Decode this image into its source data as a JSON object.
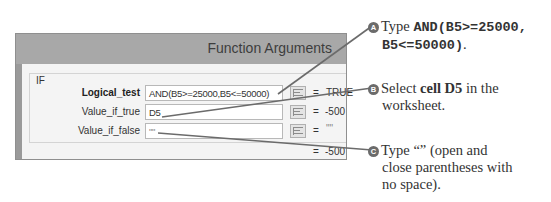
{
  "dialog": {
    "title": "Function Arguments",
    "function_name": "IF",
    "arguments": [
      {
        "label": "Logical_test",
        "value": "AND(B5>=25000,B5<=50000)",
        "equals": "=",
        "result": "TRUE",
        "bold": true
      },
      {
        "label": "Value_if_true",
        "value": "D5",
        "equals": "=",
        "result": "-500",
        "bold": false
      },
      {
        "label": "Value_if_false",
        "value": "\"\"",
        "equals": "=",
        "result": "\"\"",
        "bold": false
      }
    ],
    "formula_result_equals": "=",
    "formula_result": "-500",
    "ref_button_icon": "collapse-dialog-icon"
  },
  "callouts": [
    {
      "badge": "A",
      "prefix": "Type ",
      "code_line1": "AND(B5>=25000,",
      "code_line2": "B5<=50000)",
      "suffix": "."
    },
    {
      "badge": "B",
      "prefix": "Select ",
      "bold": "cell D5",
      "line1_rest": " in the",
      "line2": "worksheet."
    },
    {
      "badge": "C",
      "line1": "Type “” (open and",
      "line2": "close parentheses with",
      "line3": "no space)."
    }
  ],
  "colors": {
    "title_bar": "#a8a8a8",
    "dialog_body": "#f4f4f4",
    "leader_line": "#6b6b6b",
    "badge": "#6b6b6b"
  }
}
